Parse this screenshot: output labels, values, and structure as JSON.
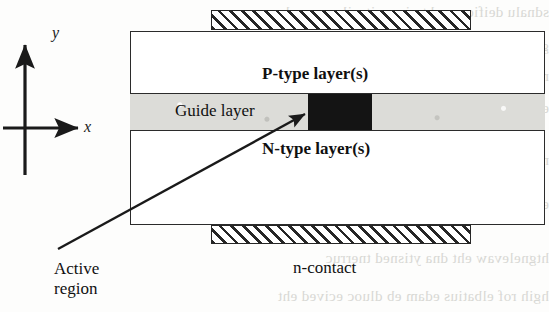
{
  "figure": {
    "kind": "semiconductor-laser-cross-section",
    "background_color": "#fdfdfc"
  },
  "axes": {
    "x_label": "x",
    "y_label": "y",
    "origin": {
      "x": 25,
      "y": 128
    },
    "color": "#1a1a1a"
  },
  "device": {
    "p_layer_label": "P-type layer(s)",
    "n_layer_label": "N-type layer(s)",
    "guide_layer_label": "Guide layer",
    "guide_layer_color": "#dcdcd8",
    "active_region_color": "#141414",
    "body_color": "#ffffff",
    "outline_color": "#2b2b2b"
  },
  "contacts": {
    "top_label": "",
    "bottom_label": "n-contact",
    "hatch_color": "#262626",
    "fill_color": "#ffffff"
  },
  "callouts": {
    "active_region_label": "Active\nregion"
  },
  "bleed_through": {
    "lines": [
      "sdnalu deificeps eht ni ,snoitacilppa resal",
      "gnitcudnocimes rof sgnitaoc dna serutcurts",
      "rewop hgih rof sreyal ediug htiw secived",
      "edoid resal fo noitarugifnoc lacipyt a si sihT",
      "noitacirbaf eht ni desu yllamron era hcihw",
      "eht ot detcennoc era stcatnoc lateM",
      "htgnelevaw eht dna ytisned tnerruc",
      "hgih rof elbatius edam eb dluoc ecived eht"
    ]
  }
}
